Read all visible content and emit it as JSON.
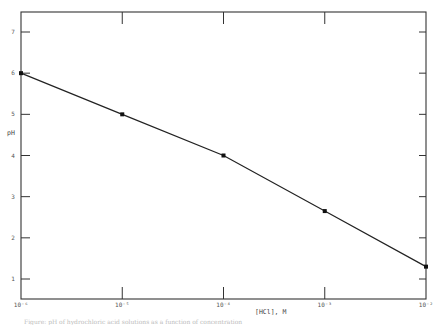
{
  "chart_data": {
    "type": "line",
    "title": "",
    "xlabel": "[HCl], M",
    "ylabel": "pH",
    "x_scale": "log",
    "x": [
      1e-06,
      1e-05,
      0.0001,
      0.001,
      0.01
    ],
    "x_tick_labels": [
      "10⁻⁶",
      "10⁻⁵",
      "10⁻⁴",
      "10⁻³",
      "10⁻²"
    ],
    "y_ticks": [
      1,
      2,
      3,
      4,
      5,
      6,
      7
    ],
    "ylim": [
      0.5,
      7.5
    ],
    "xlim": [
      1e-06,
      0.01
    ],
    "grid": false,
    "legend": null,
    "series": [
      {
        "name": "pH vs [HCl]",
        "x": [
          1e-06,
          1e-05,
          0.0001,
          0.001,
          0.01
        ],
        "values": [
          6.0,
          5.0,
          4.0,
          2.65,
          1.3
        ],
        "marker": "square"
      }
    ]
  },
  "labels": {
    "ylabel": "pH",
    "xlabel": "[HCl], M",
    "caption": "Figure: pH of hydrochloric acid solutions as a function of concentration"
  },
  "colors": {
    "axis": "#333333",
    "line": "#222222",
    "marker": "#111111"
  }
}
